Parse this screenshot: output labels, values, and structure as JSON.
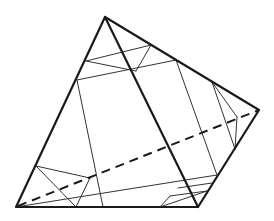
{
  "diagram": {
    "title": "",
    "stroke_color": "#1a1a1a",
    "thin_color": "#333333",
    "background": "#ffffff",
    "vertices": {
      "A_top": [
        105,
        17
      ],
      "B_right": [
        259,
        110
      ],
      "C_bottom_right": [
        198,
        207
      ],
      "D_bottom_left": [
        16,
        207
      ]
    },
    "outline": [
      [
        105,
        17
      ],
      [
        259,
        110
      ],
      [
        198,
        207
      ],
      [
        16,
        207
      ]
    ],
    "thick_diagonal": [
      [
        105,
        17
      ],
      [
        198,
        207
      ]
    ],
    "dashed_diagonal": [
      [
        18,
        206
      ],
      [
        259,
        110
      ]
    ],
    "thin_lines": [
      [
        [
          86,
          61
        ],
        [
          151,
          45
        ]
      ],
      [
        [
          86,
          61
        ],
        [
          136,
          71
        ]
      ],
      [
        [
          151,
          45
        ],
        [
          136,
          71
        ]
      ],
      [
        [
          77,
          80
        ],
        [
          176,
          60
        ]
      ],
      [
        [
          77,
          80
        ],
        [
          103,
          207
        ]
      ],
      [
        [
          176,
          60
        ],
        [
          217,
          175
        ]
      ],
      [
        [
          217,
          175
        ],
        [
          16,
          207
        ]
      ],
      [
        [
          212,
          82
        ],
        [
          237,
          117
        ]
      ],
      [
        [
          237,
          117
        ],
        [
          235,
          149
        ]
      ],
      [
        [
          212,
          82
        ],
        [
          235,
          149
        ]
      ],
      [
        [
          36,
          166
        ],
        [
          90,
          178
        ]
      ],
      [
        [
          36,
          166
        ],
        [
          76,
          207
        ]
      ],
      [
        [
          90,
          178
        ],
        [
          76,
          207
        ]
      ],
      [
        [
          170,
          196
        ],
        [
          207,
          191
        ]
      ],
      [
        [
          170,
          196
        ],
        [
          160,
          207
        ]
      ],
      [
        [
          207,
          191
        ],
        [
          160,
          207
        ]
      ],
      [
        [
          178,
          188
        ],
        [
          212,
          183
        ]
      ]
    ]
  }
}
